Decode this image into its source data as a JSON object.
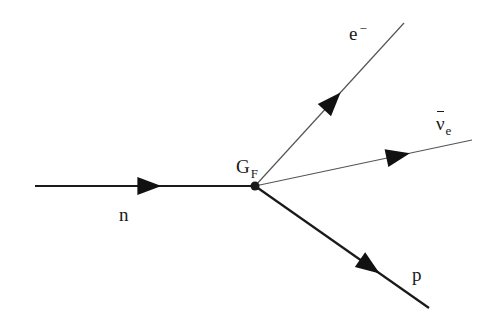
{
  "diagram": {
    "type": "feynman-diagram",
    "vertex": {
      "label": "G",
      "label_subscript": "F",
      "x": 255,
      "y": 186,
      "color": "#1a1a1a"
    },
    "particles": [
      {
        "id": "neutron",
        "label": "n",
        "direction": "incoming",
        "line": {
          "x1": 35,
          "y1": 186,
          "x2": 255,
          "y2": 186,
          "width": 2.2,
          "color": "#1a1a1a"
        },
        "arrow_at": 0.52
      },
      {
        "id": "electron",
        "label": "e",
        "label_superscript": "−",
        "direction": "outgoing",
        "line": {
          "x1": 255,
          "y1": 186,
          "x2": 404,
          "y2": 23,
          "width": 1.2,
          "color": "#555555"
        },
        "arrow_at": 0.52
      },
      {
        "id": "antineutrino",
        "label": "ν",
        "label_subscript": "e",
        "label_overbar": true,
        "direction": "outgoing",
        "line": {
          "x1": 255,
          "y1": 186,
          "x2": 472,
          "y2": 140,
          "width": 1.2,
          "color": "#555555"
        },
        "arrow_at": 0.66
      },
      {
        "id": "proton",
        "label": "p",
        "direction": "outgoing",
        "line": {
          "x1": 255,
          "y1": 186,
          "x2": 429,
          "y2": 308,
          "width": 2.2,
          "color": "#1a1a1a"
        },
        "arrow_at": 0.66
      }
    ]
  }
}
